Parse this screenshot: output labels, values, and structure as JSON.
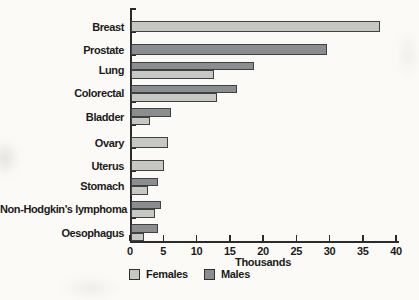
{
  "chart_data": {
    "type": "bar",
    "orientation": "horizontal",
    "title": "",
    "xlabel": "Thousands",
    "ylabel": "",
    "xlim": [
      0,
      40
    ],
    "xticks": [
      0,
      5,
      10,
      15,
      20,
      25,
      30,
      35,
      40
    ],
    "grid": false,
    "legend_position": "bottom",
    "legend": [
      {
        "name": "Females",
        "color": "#c6c8c4"
      },
      {
        "name": "Males",
        "color": "#8b8e90"
      }
    ],
    "categories": [
      "Breast",
      "Prostate",
      "Lung",
      "Colorectal",
      "Bladder",
      "Ovary",
      "Uterus",
      "Stomach",
      "Non-Hodgkin's lymphoma",
      "Oesophagus"
    ],
    "series": [
      {
        "name": "Females",
        "values": [
          37.5,
          null,
          12.5,
          13,
          2.8,
          5.5,
          5,
          2.6,
          3.6,
          2
        ]
      },
      {
        "name": "Males",
        "values": [
          null,
          29.5,
          18.5,
          16,
          6,
          null,
          null,
          4,
          4.5,
          4
        ]
      }
    ],
    "rows": [
      {
        "category": "Breast",
        "bars": [
          {
            "series": "Females",
            "value": 37.5
          }
        ]
      },
      {
        "category": "Prostate",
        "bars": [
          {
            "series": "Males",
            "value": 29.5
          }
        ]
      },
      {
        "category": "Lung",
        "bars": [
          {
            "series": "Males",
            "value": 18.5
          },
          {
            "series": "Females",
            "value": 12.5
          }
        ]
      },
      {
        "category": "Colorectal",
        "bars": [
          {
            "series": "Males",
            "value": 16
          },
          {
            "series": "Females",
            "value": 13
          }
        ]
      },
      {
        "category": "Bladder",
        "bars": [
          {
            "series": "Males",
            "value": 6
          },
          {
            "series": "Females",
            "value": 2.8
          }
        ]
      },
      {
        "category": "Ovary",
        "bars": [
          {
            "series": "Females",
            "value": 5.5
          }
        ]
      },
      {
        "category": "Uterus",
        "bars": [
          {
            "series": "Females",
            "value": 5
          }
        ]
      },
      {
        "category": "Stomach",
        "bars": [
          {
            "series": "Males",
            "value": 4
          },
          {
            "series": "Females",
            "value": 2.6
          }
        ]
      },
      {
        "category": "Non-Hodgkin's lymphoma",
        "bars": [
          {
            "series": "Males",
            "value": 4.5
          },
          {
            "series": "Females",
            "value": 3.6
          }
        ]
      },
      {
        "category": "Oesophagus",
        "bars": [
          {
            "series": "Males",
            "value": 4
          },
          {
            "series": "Females",
            "value": 2
          }
        ]
      }
    ],
    "units": "Thousands"
  },
  "colors": {
    "females": "#c6c8c4",
    "males": "#8b8e90",
    "bar_border": "#3e4041",
    "axis": "#2b2b2b",
    "text": "#1b1b1b",
    "background": "#fbfaf7"
  }
}
